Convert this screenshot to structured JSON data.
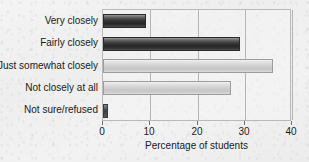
{
  "chart_data": {
    "type": "bar",
    "orientation": "horizontal",
    "title": "",
    "xlabel": "Percentage of students",
    "ylabel": "",
    "xlim": [
      0,
      40
    ],
    "xticks": [
      0,
      10,
      20,
      30,
      40
    ],
    "xtick_labels": [
      "0",
      "10",
      "20",
      "30",
      "40"
    ],
    "grid": true,
    "legend": "none",
    "categories": [
      "Very closely",
      "Fairly closely",
      "Just somewhat closely",
      "Not closely at all",
      "Not sure/refused"
    ],
    "values": [
      9,
      29,
      36,
      27,
      1
    ],
    "series": [
      {
        "name": "Percentage of students",
        "values": [
          9,
          29,
          36,
          27,
          1
        ]
      }
    ],
    "bar_styles": [
      "dark",
      "dark",
      "light",
      "light",
      "tiny"
    ],
    "colors": {
      "bar_dark": "#262626",
      "bar_light": "#c6c6c6",
      "plot_background": "#f2f2f2",
      "gridline": "#b5b5b5",
      "axis_text": "#1b1b1b"
    }
  }
}
